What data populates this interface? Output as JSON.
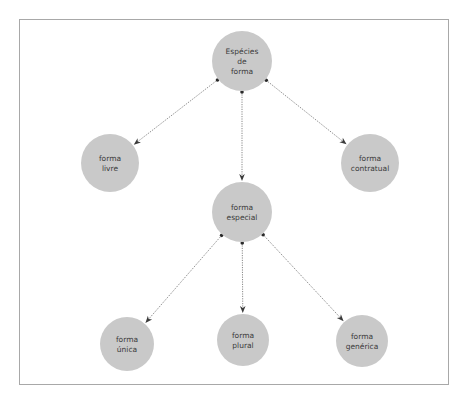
{
  "diagram": {
    "colors": {
      "node_fill": "#c9c9c9",
      "edge": "#6a6a6a",
      "text": "#3a3a3a",
      "frame": "#a8a8a8"
    },
    "nodes": [
      {
        "id": "especies",
        "lines": [
          "Espécies",
          "de",
          "forma"
        ]
      },
      {
        "id": "livre",
        "lines": [
          "forma",
          "livre"
        ]
      },
      {
        "id": "contratual",
        "lines": [
          "forma",
          "contratual"
        ]
      },
      {
        "id": "especial",
        "lines": [
          "forma",
          "especial"
        ]
      },
      {
        "id": "unica",
        "lines": [
          "forma",
          "única"
        ]
      },
      {
        "id": "plural",
        "lines": [
          "forma",
          "plural"
        ]
      },
      {
        "id": "generica",
        "lines": [
          "forma",
          "genérica"
        ]
      }
    ],
    "edges": [
      {
        "from": "especies",
        "to": "livre"
      },
      {
        "from": "especies",
        "to": "especial"
      },
      {
        "from": "especies",
        "to": "contratual"
      },
      {
        "from": "especial",
        "to": "unica"
      },
      {
        "from": "especial",
        "to": "plural"
      },
      {
        "from": "especial",
        "to": "generica"
      }
    ]
  }
}
